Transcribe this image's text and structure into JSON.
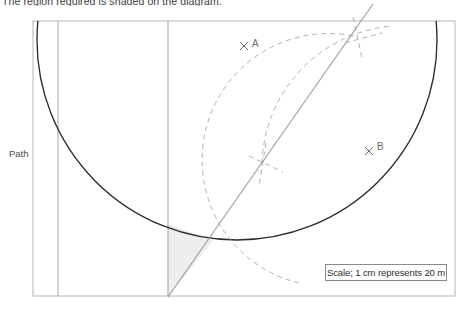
{
  "instruction": "The region required is shaded on the diagram.",
  "labels": {
    "path": "Path",
    "point_a": "A",
    "point_b": "B",
    "marker_a": "×",
    "marker_b": "×"
  },
  "scale": {
    "text": "Scale; 1 cm represents 20 m",
    "unit_length_cm": 1,
    "represents_m": 20
  },
  "colors": {
    "frame": "#b5b5b5",
    "path_line": "#9a9a9a",
    "circle": "#2b2b2b",
    "bisector": "#9a9a9a",
    "construction_arc": "#a8a8a8",
    "shading_fill": "#eeeeee",
    "shading_stroke": "#d4d4d4",
    "label_text": "#5a5a5a",
    "scale_text": "#2e2e2e",
    "background": "#ffffff"
  },
  "geometry": {
    "frame": {
      "x": 33,
      "y": 21,
      "width": 422,
      "height": 275
    },
    "path_lines": [
      {
        "name": "outer-path-edge",
        "x": 58,
        "y1": 21,
        "y2": 296
      },
      {
        "name": "inner-path-edge",
        "x": 168,
        "y1": 21,
        "y2": 296
      }
    ],
    "circle": {
      "cx": 237,
      "cy": 40,
      "r": 200
    },
    "point_a": {
      "x": 245,
      "y": 45
    },
    "point_b": {
      "x": 370,
      "y": 150
    },
    "bisector": {
      "x1": 168,
      "y1": 297,
      "x2": 373,
      "y2": 4
    },
    "construction_intersections": [
      {
        "x": 262,
        "y": 163
      },
      {
        "x": 358,
        "y": 37
      }
    ],
    "construction_arcs": [
      {
        "center": "A",
        "cx": 245,
        "cy": 45,
        "r": 125
      },
      {
        "center": "B",
        "cx": 370,
        "cy": 150,
        "r": 142
      }
    ],
    "shaded_region": "bounded by inner path edge, bisector line and circle arc"
  }
}
